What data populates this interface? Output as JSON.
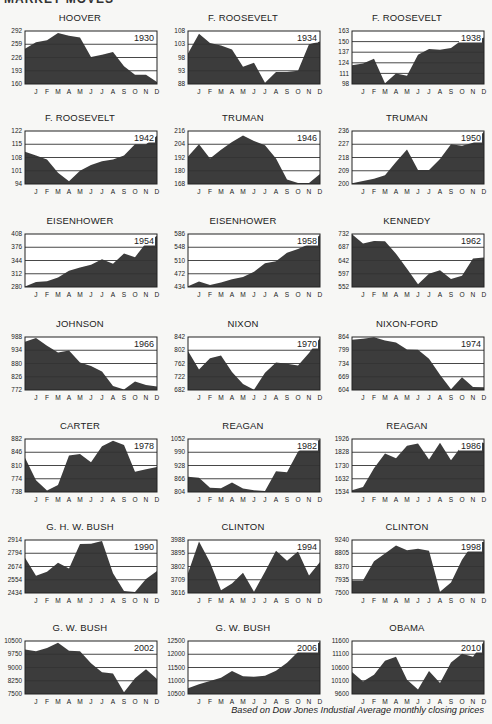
{
  "header": {
    "partial_title": "MARKET MOVES"
  },
  "caption": "Based on Dow Jones Industial Average monthly closing prices",
  "style": {
    "fill": "#3c3c3c",
    "grid": "#333333",
    "frame": "#222222",
    "background": "#f7f7f5"
  },
  "months": [
    "J",
    "F",
    "M",
    "A",
    "M",
    "J",
    "J",
    "A",
    "S",
    "O",
    "N",
    "D"
  ],
  "chart_data": [
    {
      "type": "area",
      "title": "HOOVER",
      "year": "1930",
      "yticks": [
        160,
        193,
        226,
        259,
        292
      ],
      "ylim": [
        160,
        292
      ],
      "x": [
        "start",
        "J",
        "F",
        "M",
        "A",
        "M",
        "J",
        "J",
        "A",
        "S",
        "O",
        "N",
        "D"
      ],
      "values": [
        248,
        264,
        269,
        287,
        280,
        276,
        227,
        233,
        240,
        204,
        183,
        183,
        165
      ]
    },
    {
      "type": "area",
      "title": "F. ROOSEVELT",
      "year": "1934",
      "yticks": [
        88,
        93,
        98,
        103,
        108
      ],
      "ylim": [
        88,
        108
      ],
      "x": [
        "start",
        "J",
        "F",
        "M",
        "A",
        "M",
        "J",
        "J",
        "A",
        "S",
        "O",
        "N",
        "D"
      ],
      "values": [
        99.5,
        107,
        103.5,
        102.5,
        101,
        94.5,
        96,
        88.5,
        92.5,
        92.5,
        93,
        103,
        104
      ]
    },
    {
      "type": "area",
      "title": "F. ROOSEVELT",
      "year": "1938",
      "yticks": [
        98,
        111,
        124,
        137,
        150,
        163
      ],
      "ylim": [
        98,
        163
      ],
      "x": [
        "start",
        "J",
        "F",
        "M",
        "A",
        "M",
        "J",
        "J",
        "A",
        "S",
        "O",
        "N",
        "D"
      ],
      "values": [
        121,
        123,
        129,
        99,
        111,
        108,
        134,
        141,
        140,
        142,
        152,
        150,
        155
      ]
    },
    {
      "type": "area",
      "title": "F. ROOSEVELT",
      "year": "1942",
      "yticks": [
        94,
        101,
        108,
        115,
        122
      ],
      "ylim": [
        94,
        122
      ],
      "x": [
        "start",
        "J",
        "F",
        "M",
        "A",
        "M",
        "J",
        "J",
        "A",
        "S",
        "O",
        "N",
        "D"
      ],
      "values": [
        111,
        109,
        107,
        100,
        95.5,
        101,
        104,
        106,
        107,
        109,
        115,
        115,
        119.5
      ]
    },
    {
      "type": "area",
      "title": "TRUMAN",
      "year": "1946",
      "yticks": [
        168,
        180,
        192,
        204,
        216
      ],
      "ylim": [
        168,
        216
      ],
      "x": [
        "start",
        "J",
        "F",
        "M",
        "A",
        "M",
        "J",
        "J",
        "A",
        "S",
        "O",
        "N",
        "D"
      ],
      "values": [
        193,
        204,
        191,
        199,
        206,
        212,
        207,
        203,
        191,
        172,
        169,
        169,
        177
      ]
    },
    {
      "type": "area",
      "title": "TRUMAN",
      "year": "1950",
      "yticks": [
        200,
        209,
        218,
        227,
        236
      ],
      "ylim": [
        200,
        236
      ],
      "x": [
        "start",
        "J",
        "F",
        "M",
        "A",
        "M",
        "J",
        "J",
        "A",
        "S",
        "O",
        "N",
        "D"
      ],
      "values": [
        200.5,
        202,
        203.5,
        206,
        215,
        223.5,
        209.5,
        209.5,
        217,
        227,
        226,
        228,
        235.5
      ]
    },
    {
      "type": "area",
      "title": "EISENHOWER",
      "year": "1954",
      "yticks": [
        280,
        312,
        344,
        376,
        408
      ],
      "ylim": [
        280,
        408
      ],
      "x": [
        "start",
        "J",
        "F",
        "M",
        "A",
        "M",
        "J",
        "J",
        "A",
        "S",
        "O",
        "N",
        "D"
      ],
      "values": [
        281,
        292,
        294,
        303,
        319,
        327,
        334,
        347,
        336,
        361,
        352,
        386,
        404
      ]
    },
    {
      "type": "area",
      "title": "EISENHOWER",
      "year": "1958",
      "yticks": [
        434,
        472,
        510,
        548,
        586
      ],
      "ylim": [
        434,
        586
      ],
      "x": [
        "start",
        "J",
        "F",
        "M",
        "A",
        "M",
        "J",
        "J",
        "A",
        "S",
        "O",
        "N",
        "D"
      ],
      "values": [
        436,
        450,
        440,
        447,
        456,
        463,
        478,
        502,
        508,
        532,
        543,
        557,
        583
      ]
    },
    {
      "type": "area",
      "title": "KENNEDY",
      "year": "1962",
      "yticks": [
        552,
        597,
        642,
        687,
        732
      ],
      "ylim": [
        552,
        732
      ],
      "x": [
        "start",
        "J",
        "F",
        "M",
        "A",
        "M",
        "J",
        "J",
        "A",
        "S",
        "O",
        "N",
        "D"
      ],
      "values": [
        731,
        700,
        708,
        707,
        665,
        614,
        561,
        597,
        609,
        579,
        590,
        649,
        652
      ]
    },
    {
      "type": "area",
      "title": "JOHNSON",
      "year": "1966",
      "yticks": [
        772,
        826,
        880,
        934,
        988
      ],
      "ylim": [
        772,
        988
      ],
      "x": [
        "start",
        "J",
        "F",
        "M",
        "A",
        "M",
        "J",
        "J",
        "A",
        "S",
        "O",
        "N",
        "D"
      ],
      "values": [
        969,
        984,
        952,
        925,
        933,
        884,
        870,
        847,
        788,
        774,
        807,
        792,
        786
      ]
    },
    {
      "type": "area",
      "title": "NIXON",
      "year": "1970",
      "yticks": [
        682,
        722,
        762,
        802,
        842
      ],
      "ylim": [
        682,
        842
      ],
      "x": [
        "start",
        "J",
        "F",
        "M",
        "A",
        "M",
        "J",
        "J",
        "A",
        "S",
        "O",
        "N",
        "D"
      ],
      "values": [
        800,
        744,
        778,
        786,
        736,
        700,
        683,
        734,
        765,
        761,
        756,
        794,
        839
      ]
    },
    {
      "type": "area",
      "title": "NIXON-FORD",
      "year": "1974",
      "yticks": [
        604,
        669,
        734,
        799,
        864
      ],
      "ylim": [
        604,
        864
      ],
      "x": [
        "start",
        "J",
        "F",
        "M",
        "A",
        "M",
        "J",
        "J",
        "A",
        "S",
        "O",
        "N",
        "D"
      ],
      "values": [
        851,
        855,
        863,
        847,
        837,
        803,
        802,
        757,
        679,
        608,
        666,
        619,
        617
      ]
    },
    {
      "type": "area",
      "title": "CARTER",
      "year": "1978",
      "yticks": [
        738,
        774,
        810,
        846,
        882
      ],
      "ylim": [
        738,
        882
      ],
      "x": [
        "start",
        "J",
        "F",
        "M",
        "A",
        "M",
        "J",
        "J",
        "A",
        "S",
        "O",
        "N",
        "D"
      ],
      "values": [
        831,
        770,
        742,
        757,
        837,
        841,
        819,
        862,
        877,
        866,
        793,
        800,
        806
      ]
    },
    {
      "type": "area",
      "title": "REAGAN",
      "year": "1982",
      "yticks": [
        804,
        866,
        928,
        990,
        1052
      ],
      "ylim": [
        804,
        1052
      ],
      "x": [
        "start",
        "J",
        "F",
        "M",
        "A",
        "M",
        "J",
        "J",
        "A",
        "S",
        "O",
        "N",
        "D"
      ],
      "values": [
        875,
        871,
        824,
        822,
        848,
        820,
        812,
        809,
        901,
        896,
        992,
        1039,
        1047
      ]
    },
    {
      "type": "area",
      "title": "REAGAN",
      "year": "1986",
      "yticks": [
        1534,
        1632,
        1730,
        1828,
        1926
      ],
      "ylim": [
        1534,
        1926
      ],
      "x": [
        "start",
        "J",
        "F",
        "M",
        "A",
        "M",
        "J",
        "J",
        "A",
        "S",
        "O",
        "N",
        "D"
      ],
      "values": [
        1547,
        1571,
        1709,
        1819,
        1784,
        1877,
        1893,
        1775,
        1898,
        1768,
        1878,
        1914,
        1896
      ]
    },
    {
      "type": "area",
      "title": "G. H. W. BUSH",
      "year": "1990",
      "yticks": [
        2434,
        2554,
        2674,
        2794,
        2914
      ],
      "ylim": [
        2434,
        2914
      ],
      "x": [
        "start",
        "J",
        "F",
        "M",
        "A",
        "M",
        "J",
        "J",
        "A",
        "S",
        "O",
        "N",
        "D"
      ],
      "values": [
        2753,
        2591,
        2627,
        2707,
        2657,
        2877,
        2881,
        2905,
        2614,
        2453,
        2442,
        2560,
        2634
      ]
    },
    {
      "type": "area",
      "title": "CLINTON",
      "year": "1994",
      "yticks": [
        3616,
        3709,
        3802,
        3895,
        3988
      ],
      "ylim": [
        3616,
        3988
      ],
      "x": [
        "start",
        "J",
        "F",
        "M",
        "A",
        "M",
        "J",
        "J",
        "A",
        "S",
        "O",
        "N",
        "D"
      ],
      "values": [
        3754,
        3978,
        3832,
        3636,
        3682,
        3758,
        3625,
        3765,
        3913,
        3843,
        3908,
        3739,
        3834
      ]
    },
    {
      "type": "area",
      "title": "CLINTON",
      "year": "1998",
      "yticks": [
        7500,
        7935,
        8370,
        8805,
        9240
      ],
      "ylim": [
        7500,
        9240
      ],
      "x": [
        "start",
        "J",
        "F",
        "M",
        "A",
        "M",
        "J",
        "J",
        "A",
        "S",
        "O",
        "N",
        "D"
      ],
      "values": [
        7908,
        7907,
        8546,
        8800,
        9063,
        8900,
        8952,
        8883,
        7539,
        7843,
        8592,
        9117,
        9181
      ]
    },
    {
      "type": "area",
      "title": "G. W. BUSH",
      "year": "2002",
      "yticks": [
        7500,
        8250,
        9000,
        9750,
        10500
      ],
      "ylim": [
        7500,
        10500
      ],
      "x": [
        "start",
        "J",
        "F",
        "M",
        "A",
        "M",
        "J",
        "J",
        "A",
        "S",
        "O",
        "N",
        "D"
      ],
      "values": [
        10022,
        9920,
        10106,
        10404,
        9946,
        9925,
        9243,
        8737,
        8664,
        7592,
        8397,
        8896,
        8342
      ]
    },
    {
      "type": "area",
      "title": "G. W. BUSH",
      "year": "2006",
      "yticks": [
        10500,
        11000,
        11500,
        12000,
        12500
      ],
      "ylim": [
        10500,
        12500
      ],
      "x": [
        "start",
        "J",
        "F",
        "M",
        "A",
        "M",
        "J",
        "J",
        "A",
        "S",
        "O",
        "N",
        "D"
      ],
      "values": [
        10718,
        10865,
        10993,
        11109,
        11367,
        11168,
        11150,
        11186,
        11381,
        11679,
        12081,
        12222,
        12463
      ]
    },
    {
      "type": "area",
      "title": "OBAMA",
      "year": "2010",
      "yticks": [
        9600,
        10100,
        10600,
        11100,
        11600
      ],
      "ylim": [
        9600,
        11600
      ],
      "x": [
        "start",
        "J",
        "F",
        "M",
        "A",
        "M",
        "J",
        "J",
        "A",
        "S",
        "O",
        "N",
        "D"
      ],
      "values": [
        10428,
        10067,
        10325,
        10857,
        11009,
        10137,
        9774,
        10466,
        10015,
        10788,
        11118,
        11006,
        11578
      ]
    }
  ]
}
